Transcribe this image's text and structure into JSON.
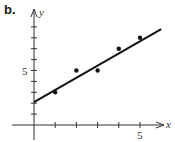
{
  "panel_label": "b.",
  "chart_data": {
    "type": "scatter",
    "title": "",
    "xlabel": "x",
    "ylabel": "y",
    "xlim": [
      0,
      6.3
    ],
    "ylim": [
      -0.6,
      10.3
    ],
    "x_ticks": [
      1,
      2,
      3,
      4,
      5
    ],
    "y_ticks": [
      1,
      2,
      3,
      4,
      5,
      6,
      7,
      8,
      9
    ],
    "x_tick_labels": [
      {
        "value": 5,
        "label": "5"
      }
    ],
    "y_tick_labels": [
      {
        "value": 5,
        "label": "5"
      }
    ],
    "grid": false,
    "series": [
      {
        "name": "data points",
        "type": "scatter",
        "x": [
          1,
          2,
          3,
          4,
          5
        ],
        "y": [
          3,
          5,
          5,
          7,
          8
        ]
      },
      {
        "name": "fitted line",
        "type": "line",
        "x": [
          0,
          6
        ],
        "y": [
          2.1,
          8.8
        ]
      }
    ]
  },
  "colors": {
    "ink": "#111111",
    "axis": "#333333"
  }
}
